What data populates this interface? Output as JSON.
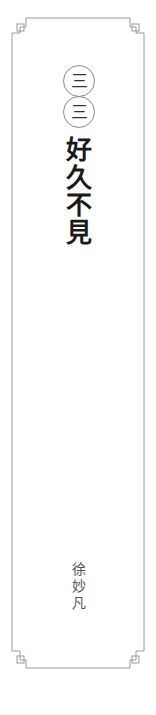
{
  "cover": {
    "series_number": [
      "三",
      "三"
    ],
    "title_chars": [
      "好",
      "久",
      "不",
      "見"
    ],
    "title": "好久不見",
    "author_chars": [
      "徐",
      "妙",
      "凡"
    ],
    "author": "徐妙凡"
  },
  "colors": {
    "background": "#ffffff",
    "frame_line": "#9a9a9a",
    "circle_border": "#8a8a8a",
    "title_text": "#1a1a1a",
    "author_text": "#555555"
  }
}
